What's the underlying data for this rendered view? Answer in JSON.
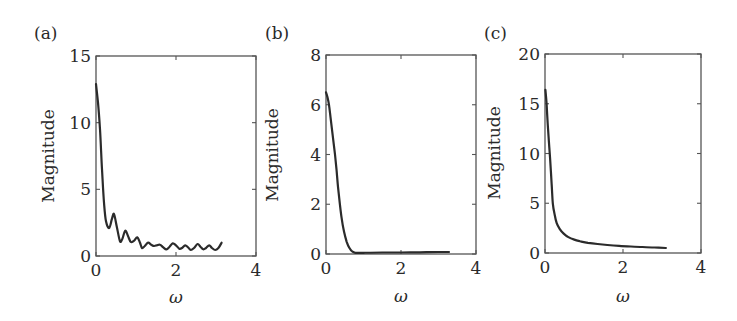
{
  "figure": {
    "background": "#ffffff",
    "line_color": "#2b2b2b",
    "frame_color": "#555555"
  },
  "chart_data": [
    {
      "type": "line",
      "panel_label": "(a)",
      "title": "",
      "xlabel": "ω",
      "ylabel": "Magnitude",
      "xlim": [
        0,
        4
      ],
      "ylim": [
        0,
        15
      ],
      "xticks": [
        0,
        2,
        4
      ],
      "xtick_labels": [
        "0",
        "2",
        "4"
      ],
      "yticks": [
        0,
        5,
        10,
        15
      ],
      "ytick_labels": [
        "0",
        "5",
        "10",
        "15"
      ],
      "grid": false,
      "legend": null,
      "frame_px": {
        "left": 96,
        "top": 56,
        "right": 256,
        "bottom": 256
      },
      "series": [
        {
          "name": "magnitude",
          "x": [
            0.0,
            0.05,
            0.1,
            0.15,
            0.2,
            0.25,
            0.33,
            0.4,
            0.45,
            0.52,
            0.6,
            0.66,
            0.73,
            0.8,
            0.87,
            0.95,
            1.03,
            1.1,
            1.15,
            1.22,
            1.3,
            1.38,
            1.45,
            1.52,
            1.6,
            1.68,
            1.76,
            1.84,
            1.92,
            2.0,
            2.08,
            2.15,
            2.23,
            2.3,
            2.37,
            2.45,
            2.54,
            2.61,
            2.68,
            2.75,
            2.83,
            2.9,
            2.98,
            3.06,
            3.14
          ],
          "y": [
            12.9,
            11.5,
            9.5,
            6.5,
            4.0,
            2.6,
            2.1,
            2.8,
            3.15,
            2.2,
            1.1,
            1.3,
            1.9,
            1.5,
            1.05,
            1.15,
            1.4,
            1.0,
            0.6,
            0.75,
            1.0,
            0.85,
            0.75,
            0.8,
            0.85,
            0.65,
            0.5,
            0.7,
            0.95,
            0.8,
            0.55,
            0.6,
            0.8,
            0.65,
            0.45,
            0.6,
            0.9,
            0.7,
            0.5,
            0.6,
            0.8,
            0.6,
            0.45,
            0.6,
            1.0
          ]
        }
      ]
    },
    {
      "type": "line",
      "panel_label": "(b)",
      "title": "",
      "xlabel": "ω",
      "ylabel": "Magnitude",
      "xlim": [
        0,
        4
      ],
      "ylim": [
        0,
        8
      ],
      "xticks": [
        0,
        2,
        4
      ],
      "xtick_labels": [
        "0",
        "2",
        "4"
      ],
      "yticks": [
        0,
        2,
        4,
        6,
        8
      ],
      "ytick_labels": [
        "0",
        "2",
        "4",
        "6",
        "8"
      ],
      "grid": false,
      "legend": null,
      "frame_px": {
        "left": 326,
        "top": 55,
        "right": 476,
        "bottom": 254
      },
      "series": [
        {
          "name": "magnitude",
          "x": [
            0.0,
            0.04,
            0.08,
            0.12,
            0.16,
            0.2,
            0.24,
            0.28,
            0.32,
            0.37,
            0.42,
            0.48,
            0.55,
            0.62,
            0.7,
            0.78,
            1.0,
            1.5,
            2.0,
            2.5,
            3.0,
            3.28
          ],
          "y": [
            6.5,
            6.3,
            6.0,
            5.5,
            5.0,
            4.5,
            4.0,
            3.4,
            2.7,
            2.0,
            1.4,
            0.9,
            0.5,
            0.25,
            0.1,
            0.05,
            0.05,
            0.06,
            0.06,
            0.07,
            0.08,
            0.08
          ]
        }
      ]
    },
    {
      "type": "line",
      "panel_label": "(c)",
      "title": "",
      "xlabel": "ω",
      "ylabel": "Magnitude",
      "xlim": [
        0,
        4
      ],
      "ylim": [
        0,
        20
      ],
      "xticks": [
        0,
        2,
        4
      ],
      "xtick_labels": [
        "0",
        "2",
        "4"
      ],
      "yticks": [
        0,
        5,
        10,
        15,
        20
      ],
      "ytick_labels": [
        "0",
        "5",
        "10",
        "15",
        "20"
      ],
      "grid": false,
      "legend": null,
      "frame_px": {
        "left": 545,
        "top": 54,
        "right": 701,
        "bottom": 253
      },
      "series": [
        {
          "name": "magnitude",
          "x": [
            0.01,
            0.04,
            0.07,
            0.1,
            0.13,
            0.17,
            0.2,
            0.25,
            0.3,
            0.38,
            0.48,
            0.6,
            0.75,
            0.9,
            1.1,
            1.35,
            1.6,
            1.9,
            2.2,
            2.5,
            2.8,
            3.1
          ],
          "y": [
            16.4,
            15.0,
            13.0,
            11.2,
            9.5,
            7.0,
            5.0,
            3.8,
            3.0,
            2.4,
            1.95,
            1.6,
            1.35,
            1.18,
            1.02,
            0.9,
            0.8,
            0.72,
            0.65,
            0.6,
            0.55,
            0.5
          ]
        }
      ]
    }
  ]
}
